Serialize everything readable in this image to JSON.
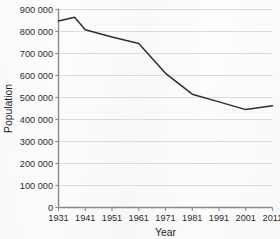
{
  "chart_data": {
    "type": "line",
    "title": "",
    "xlabel": "Year",
    "ylabel": "Population",
    "x": [
      1931,
      1937,
      1941,
      1951,
      1961,
      1971,
      1981,
      1991,
      2001,
      2011
    ],
    "values": [
      848000,
      865000,
      808000,
      775000,
      745000,
      610000,
      515000,
      480000,
      445000,
      462000
    ],
    "series": [
      {
        "name": "Population",
        "color": "#2e2e2e",
        "values": [
          848000,
          865000,
          808000,
          775000,
          745000,
          610000,
          515000,
          480000,
          445000,
          462000
        ]
      }
    ],
    "xlim": [
      1931,
      2011
    ],
    "ylim": [
      0,
      900000
    ],
    "xticks": [
      1931,
      1941,
      1951,
      1961,
      1971,
      1981,
      1991,
      2001,
      2011
    ],
    "xticklabels": [
      "1931",
      "1941",
      "1951",
      "1961",
      "1971",
      "1981",
      "1991",
      "2001",
      "2011"
    ],
    "yticks": [
      0,
      100000,
      200000,
      300000,
      400000,
      500000,
      600000,
      700000,
      800000,
      900000
    ],
    "yticklabels": [
      "0",
      "100 000",
      "200 000",
      "300 000",
      "400 000",
      "500 000",
      "600 000",
      "700 000",
      "800 000",
      "900 000"
    ],
    "grid": "horizontal",
    "grid_color": "#d8d8d8",
    "axis_color": "#8a8a8a",
    "legend": "none",
    "background": "#fdfdfd"
  }
}
